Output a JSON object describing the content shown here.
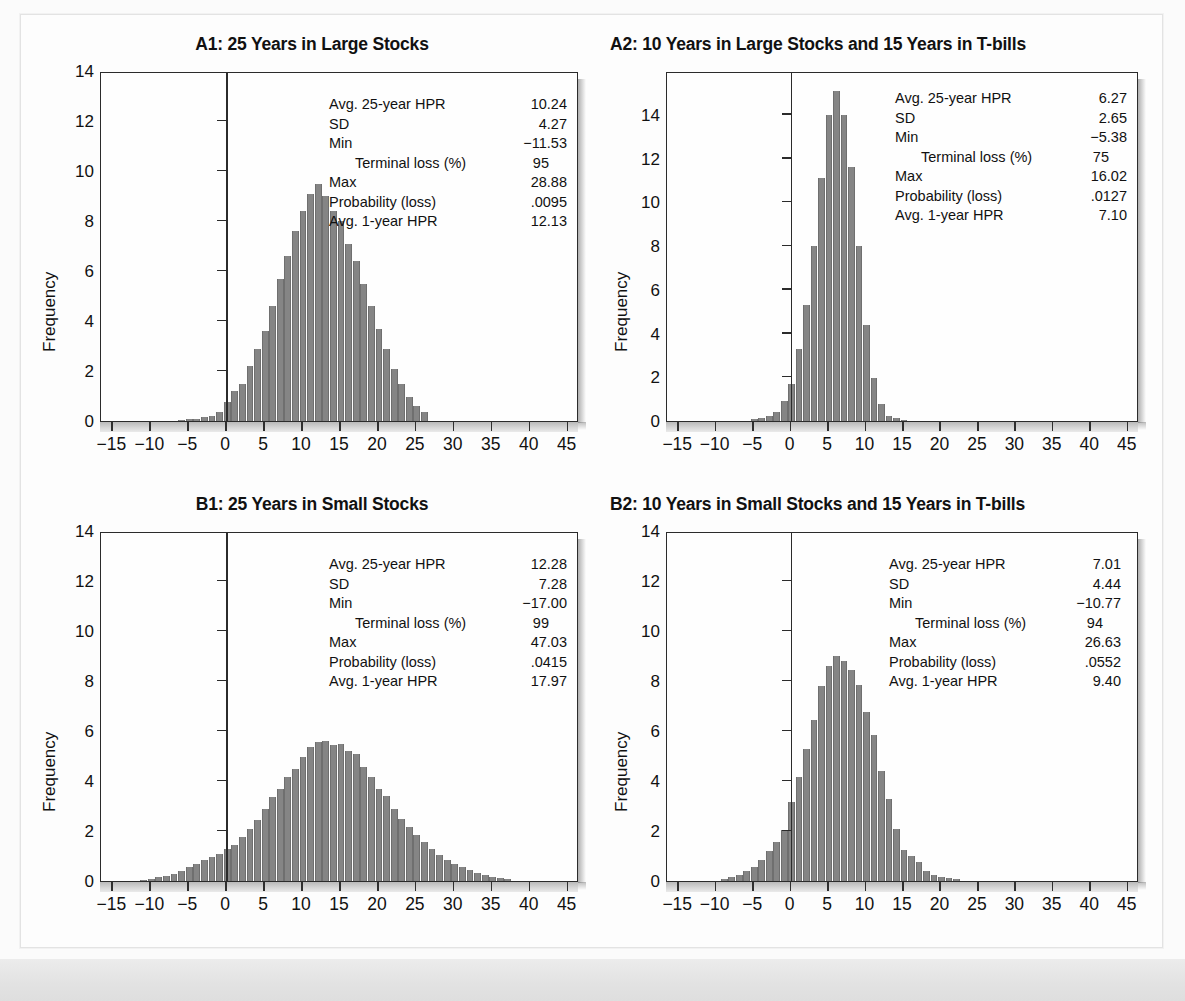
{
  "figure": {
    "y_axis_label": "Frequency",
    "x_ticks": [
      -15,
      -10,
      -5,
      0,
      5,
      10,
      15,
      20,
      25,
      30,
      35,
      40,
      45
    ],
    "x_tick_labels": [
      "−15",
      "−10",
      "−5",
      "0",
      "5",
      "10",
      "15",
      "20",
      "25",
      "30",
      "35",
      "40",
      "45"
    ],
    "y_ticks": [
      0,
      2,
      4,
      6,
      8,
      10,
      12,
      14
    ],
    "stat_labels": {
      "avg25": "Avg. 25-year HPR",
      "sd": "SD",
      "min": "Min",
      "terminal_loss": "Terminal loss (%)",
      "max": "Max",
      "prob_loss": "Probability (loss)",
      "avg1": "Avg. 1-year HPR"
    },
    "bar_color": "#858585",
    "frame_color": "#2b2b2b"
  },
  "chart_data": [
    {
      "id": "A1",
      "type": "bar",
      "title": "A1: 25 Years in Large Stocks",
      "xlabel": "",
      "ylabel": "Frequency",
      "xlim": [
        -16.5,
        46.5
      ],
      "ylim": [
        0,
        14
      ],
      "bin_width": 1,
      "x": [
        -6,
        -5,
        -4,
        -3,
        -2,
        -1,
        0,
        1,
        2,
        3,
        4,
        5,
        6,
        7,
        8,
        9,
        10,
        11,
        12,
        13,
        14,
        15,
        16,
        17,
        18,
        19,
        20,
        21,
        22,
        23,
        24,
        25,
        26
      ],
      "values": [
        0.05,
        0.08,
        0.1,
        0.15,
        0.2,
        0.35,
        0.75,
        1.2,
        1.5,
        2.2,
        2.9,
        3.6,
        4.6,
        5.7,
        6.6,
        7.6,
        8.4,
        9.1,
        9.5,
        9.0,
        8.4,
        8.0,
        7.1,
        6.4,
        5.5,
        4.6,
        3.7,
        2.9,
        2.1,
        1.5,
        0.95,
        0.6,
        0.35
      ],
      "stats": {
        "avg25": "10.24",
        "sd": "4.27",
        "min": "−11.53",
        "terminal_loss": "95",
        "max": "28.88",
        "prob_loss": ".0095",
        "avg1": "12.13"
      }
    },
    {
      "id": "A2",
      "type": "bar",
      "title": "A2: 10 Years in Large Stocks and 15 Years in T-bills",
      "xlabel": "",
      "ylabel": "Frequency",
      "xlim": [
        -16.5,
        46.5
      ],
      "ylim": [
        0,
        16
      ],
      "bin_width": 1,
      "x": [
        -5,
        -4,
        -3,
        -2,
        -1,
        0,
        1,
        2,
        3,
        4,
        5,
        6,
        7,
        8,
        9,
        10,
        11,
        12,
        13,
        14,
        15
      ],
      "values": [
        0.1,
        0.15,
        0.25,
        0.4,
        0.9,
        1.7,
        3.3,
        5.3,
        8.0,
        11.1,
        14.0,
        15.1,
        14.0,
        11.6,
        8.0,
        4.4,
        1.95,
        0.8,
        0.25,
        0.12,
        0.06
      ],
      "stats": {
        "avg25": "6.27",
        "sd": "2.65",
        "min": "−5.38",
        "terminal_loss": "75",
        "max": "16.02",
        "prob_loss": ".0127",
        "avg1": "7.10"
      }
    },
    {
      "id": "B1",
      "type": "bar",
      "title": "B1: 25 Years in Small Stocks",
      "xlabel": "",
      "ylabel": "Frequency",
      "xlim": [
        -16.5,
        46.5
      ],
      "ylim": [
        0,
        14
      ],
      "bin_width": 1,
      "x": [
        -11,
        -10,
        -9,
        -8,
        -7,
        -6,
        -5,
        -4,
        -3,
        -2,
        -1,
        0,
        1,
        2,
        3,
        4,
        5,
        6,
        7,
        8,
        9,
        10,
        11,
        12,
        13,
        14,
        15,
        16,
        17,
        18,
        19,
        20,
        21,
        22,
        23,
        24,
        25,
        26,
        27,
        28,
        29,
        30,
        31,
        32,
        33,
        34,
        35,
        36,
        37
      ],
      "values": [
        0.05,
        0.1,
        0.15,
        0.2,
        0.3,
        0.4,
        0.55,
        0.7,
        0.85,
        0.95,
        1.1,
        1.3,
        1.45,
        1.75,
        2.1,
        2.45,
        2.9,
        3.35,
        3.7,
        4.15,
        4.5,
        4.95,
        5.35,
        5.55,
        5.6,
        5.45,
        5.5,
        5.2,
        5.1,
        4.55,
        4.15,
        3.7,
        3.4,
        2.9,
        2.5,
        2.15,
        1.85,
        1.55,
        1.3,
        1.05,
        0.85,
        0.7,
        0.55,
        0.45,
        0.32,
        0.25,
        0.18,
        0.12,
        0.08
      ],
      "stats": {
        "avg25": "12.28",
        "sd": "7.28",
        "min": "−17.00",
        "terminal_loss": "99",
        "max": "47.03",
        "prob_loss": ".0415",
        "avg1": "17.97"
      }
    },
    {
      "id": "B2",
      "type": "bar",
      "title": "B2: 10 Years in Small Stocks and 15 Years in T-bills",
      "xlabel": "",
      "ylabel": "Frequency",
      "xlim": [
        -16.5,
        46.5
      ],
      "ylim": [
        0,
        14
      ],
      "bin_width": 1,
      "x": [
        -9,
        -8,
        -7,
        -6,
        -5,
        -4,
        -3,
        -2,
        -1,
        0,
        1,
        2,
        3,
        4,
        5,
        6,
        7,
        8,
        9,
        10,
        11,
        12,
        13,
        14,
        15,
        16,
        17,
        18,
        19,
        20,
        21,
        22
      ],
      "values": [
        0.08,
        0.15,
        0.25,
        0.4,
        0.55,
        0.85,
        1.2,
        1.55,
        2.05,
        3.15,
        4.15,
        5.3,
        6.45,
        7.8,
        8.6,
        9.0,
        8.8,
        8.45,
        7.85,
        6.75,
        5.85,
        4.4,
        3.3,
        2.1,
        1.25,
        1.0,
        0.75,
        0.4,
        0.25,
        0.18,
        0.12,
        0.08
      ],
      "stats": {
        "avg25": "7.01",
        "sd": "4.44",
        "min": "−10.77",
        "terminal_loss": "94",
        "max": "26.63",
        "prob_loss": ".0552",
        "avg1": "9.40"
      }
    }
  ]
}
